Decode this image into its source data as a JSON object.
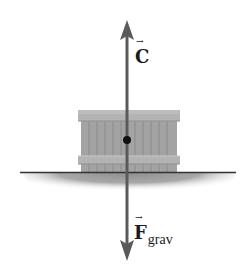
{
  "diagram": {
    "forces": [
      {
        "id": "contact",
        "symbol": "C",
        "direction": "up"
      },
      {
        "id": "gravity",
        "symbol": "F",
        "subscript": "grav",
        "direction": "down"
      }
    ],
    "vector_arrow": "→",
    "colors": {
      "arrow": "#5a5a5a",
      "crate_body": "#a3a3a3",
      "crate_slat_line": "#8a8a8a",
      "crate_band": "#b9b9b9",
      "ground_shadow": "#9c9c9c",
      "ground_line": "#333333",
      "dot": "#111111"
    }
  }
}
